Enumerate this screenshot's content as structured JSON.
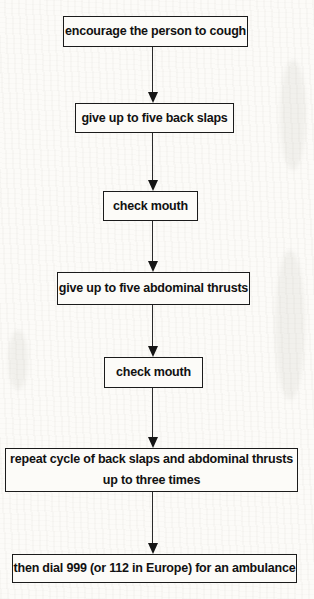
{
  "diagram": {
    "type": "flowchart",
    "direction": "top-down",
    "nodes": [
      {
        "id": "encourage-cough",
        "label": "encourage the person to cough"
      },
      {
        "id": "back-slaps",
        "label": "give up to five back slaps"
      },
      {
        "id": "check-mouth-1",
        "label": "check mouth"
      },
      {
        "id": "abdominal-thrusts",
        "label": "give up to five abdominal thrusts"
      },
      {
        "id": "check-mouth-2",
        "label": "check mouth"
      },
      {
        "id": "repeat-cycle",
        "lines": [
          "repeat cycle of back slaps and abdominal thrusts",
          "up to three times"
        ]
      },
      {
        "id": "dial-ambulance",
        "label": "then dial 999 (or 112 in Europe) for an ambulance"
      }
    ],
    "edges": [
      {
        "from": "encourage-cough",
        "to": "back-slaps"
      },
      {
        "from": "back-slaps",
        "to": "check-mouth-1"
      },
      {
        "from": "check-mouth-1",
        "to": "abdominal-thrusts"
      },
      {
        "from": "abdominal-thrusts",
        "to": "check-mouth-2"
      },
      {
        "from": "check-mouth-2",
        "to": "repeat-cycle"
      },
      {
        "from": "repeat-cycle",
        "to": "dial-ambulance"
      }
    ]
  },
  "colors": {
    "background": "#fcfbf8",
    "box_border": "#1b1b1b",
    "text": "#111111",
    "arrow": "#1b1b1b"
  }
}
